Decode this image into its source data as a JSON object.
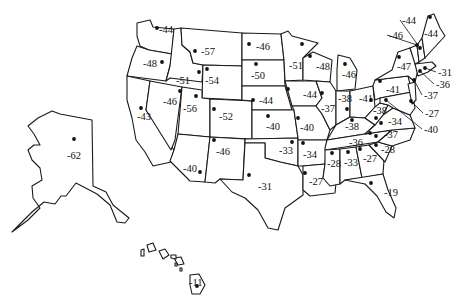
{
  "map": {
    "title": "Record low temperatures by state",
    "unit": "°F",
    "states": [
      {
        "name": "Washington",
        "value": "-44",
        "dot": [
          157,
          28
        ],
        "label": [
          159,
          33
        ]
      },
      {
        "name": "Oregon",
        "value": "-48",
        "dot": [
          162,
          62
        ],
        "label": [
          143,
          67
        ]
      },
      {
        "name": "California",
        "value": "-43",
        "dot": [
          141,
          108
        ],
        "label": [
          137,
          120
        ]
      },
      {
        "name": "Idaho",
        "value": "-51",
        "dot": [
          199,
          72
        ],
        "label": [
          176,
          84
        ]
      },
      {
        "name": "Nevada",
        "value": "-46",
        "dot": [
          180,
          91
        ],
        "label": [
          163,
          105
        ]
      },
      {
        "name": "Montana",
        "value": "-57",
        "dot": [
          195,
          51
        ],
        "label": [
          201,
          55
        ]
      },
      {
        "name": "Wyoming",
        "value": "-54",
        "dot": [
          207,
          69
        ],
        "label": [
          205,
          84
        ]
      },
      {
        "name": "Utah",
        "value": "-56",
        "dot": [
          196,
          96
        ],
        "label": [
          183,
          112
        ]
      },
      {
        "name": "Colorado",
        "value": "-52",
        "dot": [
          214,
          109
        ],
        "label": [
          219,
          120
        ]
      },
      {
        "name": "Arizona",
        "value": "-40",
        "dot": [
          200,
          172
        ],
        "label": [
          183,
          172
        ]
      },
      {
        "name": "New Mexico",
        "value": "-46",
        "dot": [
          214,
          140
        ],
        "label": [
          216,
          155
        ]
      },
      {
        "name": "North Dakota",
        "value": "-46",
        "dot": [
          249,
          44
        ],
        "label": [
          256,
          50
        ]
      },
      {
        "name": "South Dakota",
        "value": "-50",
        "dot": [
          256,
          64
        ],
        "label": [
          251,
          79
        ]
      },
      {
        "name": "Nebraska",
        "value": "-44",
        "dot": [
          253,
          100
        ],
        "label": [
          259,
          104
        ]
      },
      {
        "name": "Kansas",
        "value": "-40",
        "dot": [
          268,
          116
        ],
        "label": [
          266,
          130
        ]
      },
      {
        "name": "Oklahoma",
        "value": "-33",
        "dot": [
          292,
          142
        ],
        "label": [
          279,
          154
        ]
      },
      {
        "name": "Texas",
        "value": "-31",
        "dot": [
          249,
          175
        ],
        "label": [
          258,
          190
        ]
      },
      {
        "name": "Minnesota",
        "value": "-51",
        "dot": [
          302,
          44
        ],
        "label": [
          289,
          69
        ]
      },
      {
        "name": "Iowa",
        "value": "-44",
        "dot": [
          288,
          89
        ],
        "label": [
          303,
          98
        ]
      },
      {
        "name": "Missouri",
        "value": "-40",
        "dot": [
          298,
          118
        ],
        "label": [
          300,
          131
        ]
      },
      {
        "name": "Arkansas",
        "value": "-34",
        "dot": [
          303,
          143
        ],
        "label": [
          303,
          158
        ]
      },
      {
        "name": "Louisiana",
        "value": "-27",
        "dot": [
          305,
          173
        ],
        "label": [
          309,
          185
        ]
      },
      {
        "name": "Wisconsin",
        "value": "-48",
        "dot": [
          310,
          56
        ],
        "label": [
          316,
          70
        ]
      },
      {
        "name": "Illinois",
        "value": "-37",
        "dot": [
          322,
          93
        ],
        "label": [
          321,
          112
        ]
      },
      {
        "name": "Michigan",
        "value": "-46",
        "dot": [
          345,
          64
        ],
        "label": [
          342,
          78
        ]
      },
      {
        "name": "Indiana",
        "value": "-38",
        "dot": [
          347,
          109
        ],
        "label": [
          338,
          102
        ]
      },
      {
        "name": "Ohio",
        "value": "-41",
        "dot": [
          371,
          100
        ],
        "label": [
          359,
          102
        ]
      },
      {
        "name": "Kentucky",
        "value": "-38",
        "dot": [
          352,
          120
        ],
        "label": [
          345,
          130
        ]
      },
      {
        "name": "Tennessee",
        "value": "-36",
        "dot": [
          370,
          133
        ],
        "label": [
          349,
          146
        ]
      },
      {
        "name": "Mississippi",
        "value": "-28",
        "dot": [
          332,
          153
        ],
        "label": [
          327,
          167
        ]
      },
      {
        "name": "Alabama",
        "value": "-33",
        "dot": [
          348,
          152
        ],
        "label": [
          344,
          166
        ]
      },
      {
        "name": "Georgia",
        "value": "-27",
        "dot": [
          360,
          149
        ],
        "label": [
          363,
          162
        ]
      },
      {
        "name": "Florida",
        "value": "-19",
        "dot": [
          371,
          183
        ],
        "label": [
          384,
          196
        ]
      },
      {
        "name": "South Carolina",
        "value": "-28",
        "dot": [
          376,
          145
        ],
        "label": [
          381,
          153
        ]
      },
      {
        "name": "North Carolina",
        "value": "-37",
        "dot": [
          376,
          136
        ],
        "label": [
          384,
          138
        ]
      },
      {
        "name": "Virginia",
        "value": "-34",
        "dot": [
          381,
          123
        ],
        "label": [
          388,
          125
        ]
      },
      {
        "name": "West Virginia",
        "value": "-38",
        "dot": [
          376,
          118
        ],
        "label": [
          373,
          114
        ]
      },
      {
        "name": "Pennsylvania",
        "value": "-41",
        "dot": [
          380,
          81
        ],
        "label": [
          386,
          93
        ]
      },
      {
        "name": "New York",
        "value": "-47",
        "dot": [
          399,
          57
        ],
        "label": [
          397,
          70
        ]
      },
      {
        "name": "Maryland",
        "value": "-40",
        "dot": [
          386,
          100
        ],
        "label": [
          424,
          133
        ],
        "leader": true
      },
      {
        "name": "Delaware",
        "value": "-27",
        "dot": [
          411,
          101
        ],
        "label": [
          425,
          117
        ],
        "leader": true
      },
      {
        "name": "New Jersey",
        "value": "-37",
        "dot": [
          414,
          80
        ],
        "label": [
          424,
          99
        ],
        "leader": true
      },
      {
        "name": "Connecticut",
        "value": "-36",
        "dot": [
          420,
          71
        ],
        "label": [
          436,
          88
        ],
        "leader": true
      },
      {
        "name": "Rhode Island / Massachusetts",
        "value": "-31",
        "dot": [
          425,
          68
        ],
        "label": [
          438,
          76
        ],
        "leader": true
      },
      {
        "name": "Vermont",
        "value": "-46",
        "dot": [
          417,
          45
        ],
        "label": [
          389,
          39
        ],
        "leader": true
      },
      {
        "name": "New Hampshire",
        "value": "-44",
        "dot": [
          420,
          48
        ],
        "label": [
          402,
          24
        ],
        "leader": true
      },
      {
        "name": "Maine",
        "value": "-44",
        "dot": [
          430,
          17
        ],
        "label": [
          424,
          37
        ]
      },
      {
        "name": "Alaska",
        "value": "-62",
        "dot": [
          74,
          139
        ],
        "label": [
          67,
          159
        ]
      },
      {
        "name": "Hawaii",
        "value": "-11",
        "dot": [
          197,
          286
        ],
        "label": [
          189,
          286
        ]
      }
    ]
  }
}
